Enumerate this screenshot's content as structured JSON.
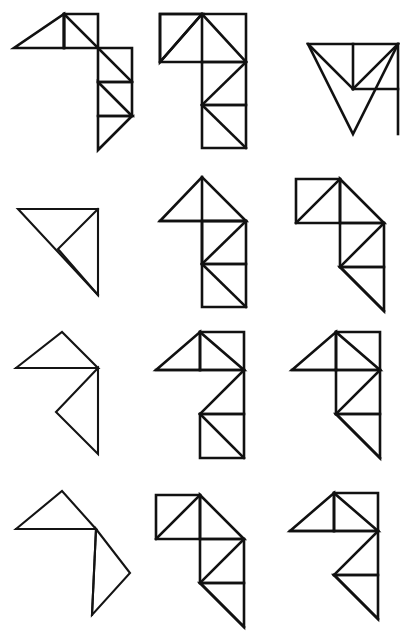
{
  "page": {
    "background_color": "#ffffff",
    "ink_color": "#111111",
    "columns": 3,
    "rows": 4,
    "cell_width": 138,
    "cell_height": 159,
    "figure_count": 12
  },
  "figures": [
    {
      "id": "fig-r1c1",
      "row": 1,
      "column": 1,
      "name": "pinwheel-seven-piece",
      "piece_count": 7,
      "description": "Large left triangle with square block upper right and stepped triangles descending to lower right",
      "viewbox": "0 0 138 159",
      "paths": [
        "M 14 48 L 64 48 L 64 14 Z",
        "M 64 14 L 64 48 L 98 48 Z",
        "M 64 14 L 98 14 L 98 48 Z",
        "M 98 14 L 98 48 L 98 14 Z",
        "M 64 48 L 98 48 L 98 14",
        "M 98 48 L 98 14",
        "M 64 14 L 98 48",
        "M 98 48 L 132 48 L 132 82 L 98 82 Z",
        "M 98 48 L 132 82",
        "M 98 82 L 132 82 L 132 116 Z",
        "M 98 82 L 98 116 L 132 116",
        "M 98 116 L 132 116 L 98 150 Z"
      ]
    },
    {
      "id": "fig-r1c2",
      "row": 1,
      "column": 2,
      "name": "tee-shape-seven-piece",
      "piece_count": 7,
      "description": "T shape: wide rectangular bar on top with inscribed triangles, vertical column below with zigzag triangles",
      "viewbox": "0 0 138 159",
      "paths": [
        "M 22 14 L 22 62 L 108 62 L 108 14 Z",
        "M 22 14 L 64 14 L 22 62",
        "M 22 62 L 64 14 L 108 62",
        "M 64 14 L 64 62",
        "M 64 62 L 108 62 L 108 105 L 64 105 Z",
        "M 108 62 L 64 105",
        "M 64 105 L 108 105 L 108 148 L 64 148 Z",
        "M 64 105 L 108 148",
        "M 64 148 L 108 148"
      ]
    },
    {
      "id": "fig-r1c3",
      "row": 1,
      "column": 3,
      "name": "corner-triangle-seven-piece",
      "piece_count": 7,
      "description": "Right triangle pointing down-right with internal square and small triangles at top-right corner",
      "viewbox": "0 0 138 159",
      "paths": [
        "M 32 44 L 122 44 L 77 134 Z",
        "M 32 44 L 77 89 L 122 44",
        "M 77 44 L 77 89",
        "M 77 89 L 122 89",
        "M 77 89 L 122 44 L 122 89",
        "M 122 44 L 122 134 L 77 134",
        "M 122 89 L 122 134 L 77 134 Z"
      ]
    },
    {
      "id": "fig-r2c1",
      "row": 2,
      "column": 1,
      "name": "plain-right-triangle",
      "piece_count": 2,
      "description": "Simple right triangle with apex at bottom, one internal line from hypotenuse midpoint",
      "viewbox": "0 0 138 159",
      "paths": [
        "M 18 50 L 98 50 L 98 136 Z",
        "M 98 50 L 58 90",
        "M 58 90 L 98 136"
      ]
    },
    {
      "id": "fig-r2c2",
      "row": 2,
      "column": 2,
      "name": "arrow-up-shape",
      "piece_count": 7,
      "description": "Upward triangle head on top of a vertical rectangular column with zigzag triangles",
      "viewbox": "0 0 138 159",
      "paths": [
        "M 22 62 L 64 18 L 108 62 Z",
        "M 64 18 L 64 105",
        "M 64 62 L 108 62 L 108 105 L 64 105 Z",
        "M 108 62 L 64 105",
        "M 64 105 L 108 105 L 108 148 L 64 148 Z",
        "M 64 105 L 108 148",
        "M 22 62 L 108 62"
      ]
    },
    {
      "id": "fig-r2c3",
      "row": 2,
      "column": 3,
      "name": "zigzag-stair-shape",
      "piece_count": 7,
      "description": "Square block upper left, triangle peak, stepping down to right with stacked triangles",
      "viewbox": "0 0 138 159",
      "paths": [
        "M 20 20 L 20 64 L 64 64 L 64 20 Z",
        "M 20 64 L 64 20",
        "M 64 20 L 108 64 L 64 64 Z",
        "M 64 64 L 108 64",
        "M 64 64 L 108 64 L 108 108 L 64 108 Z",
        "M 108 64 L 64 108",
        "M 64 108 L 108 108 L 108 152 Z",
        "M 64 108 L 108 152"
      ]
    },
    {
      "id": "fig-r3c1",
      "row": 3,
      "column": 1,
      "name": "outline-seven-arrow",
      "piece_count": 2,
      "description": "Outline-only figure: triangle peak on top, notched arrow body below, no internal subdivision",
      "viewbox": "0 0 138 159",
      "paths": [
        "M 16 50 L 62 14 L 98 50 Z",
        "M 16 50 L 98 50",
        "M 98 50 L 98 136 L 56 94 Z",
        "M 98 50 L 56 94 L 98 136"
      ]
    },
    {
      "id": "fig-r3c2",
      "row": 3,
      "column": 2,
      "name": "seven-digit-shape",
      "piece_count": 7,
      "description": "Numeral seven shape: triangular head with square, diagonal stroke, square foot with diagonal",
      "viewbox": "0 0 138 159",
      "paths": [
        "M 18 52 L 62 14 L 62 52 Z",
        "M 62 14 L 62 52",
        "M 62 14 L 106 52 L 62 52 Z",
        "M 62 14 L 106 14 L 106 52",
        "M 18 52 L 106 52",
        "M 106 52 L 62 96",
        "M 106 52 L 106 96 L 62 96",
        "M 62 96 L 106 96 L 106 140 L 62 140 Z",
        "M 62 96 L 106 140"
      ]
    },
    {
      "id": "fig-r3c3",
      "row": 3,
      "column": 3,
      "name": "flag-shape",
      "piece_count": 7,
      "description": "Triangle head left, tall right column with diagonals, bottom triangle pointing down-right",
      "viewbox": "0 0 138 159",
      "paths": [
        "M 16 52 L 60 14 L 60 52 Z",
        "M 60 14 L 60 52",
        "M 60 14 L 104 52 L 60 52 Z",
        "M 60 14 L 104 14 L 104 52",
        "M 16 52 L 104 52",
        "M 60 52 L 60 96",
        "M 104 52 L 60 96",
        "M 104 52 L 104 96 L 60 96",
        "M 60 96 L 104 96 L 104 140 Z",
        "M 60 96 L 104 140"
      ]
    },
    {
      "id": "fig-r4c1",
      "row": 4,
      "column": 1,
      "name": "outline-flag-shape",
      "piece_count": 2,
      "description": "Outline-only: triangle peak top left, long horizontal base, triangular tail descending to bottom",
      "viewbox": "0 0 138 159",
      "paths": [
        "M 16 52 L 62 14 L 96 52 Z",
        "M 16 52 L 96 52",
        "M 96 52 L 130 96 L 92 138 Z",
        "M 96 52 L 92 138"
      ]
    },
    {
      "id": "fig-r4c2",
      "row": 4,
      "column": 2,
      "name": "stair-descend-shape",
      "piece_count": 7,
      "description": "Square block upper left with diagonal, triangle peak, column stepping down right to pointed tail",
      "viewbox": "0 0 138 159",
      "paths": [
        "M 18 18 L 18 62 L 62 62 L 62 18 Z",
        "M 18 62 L 62 18",
        "M 62 18 L 106 62 L 62 62 Z",
        "M 62 62 L 106 62",
        "M 62 62 L 106 62 L 106 106 L 62 106 Z",
        "M 106 62 L 62 106",
        "M 62 106 L 106 106 L 106 150 Z",
        "M 62 106 L 106 150"
      ]
    },
    {
      "id": "fig-r4c3",
      "row": 4,
      "column": 3,
      "name": "seven-pointed-tail-shape",
      "piece_count": 7,
      "description": "Triangle head with square top right, diagonal mid stroke, wide bottom triangle with pointed tail",
      "viewbox": "0 0 138 159",
      "paths": [
        "M 14 54 L 58 16 L 58 54 Z",
        "M 58 16 L 58 54",
        "M 58 16 L 102 54 L 58 54 Z",
        "M 58 16 L 102 16 L 102 54",
        "M 14 54 L 102 54",
        "M 102 54 L 58 98",
        "M 102 54 L 102 98 L 58 98",
        "M 58 98 L 102 98 L 102 142 Z",
        "M 58 98 L 102 142"
      ]
    }
  ]
}
